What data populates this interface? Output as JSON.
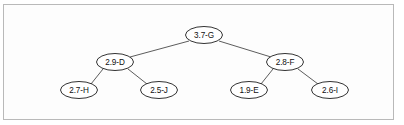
{
  "figure": {
    "kind": "binary-tree-diagram",
    "border_color": "#b9b9b9",
    "background_color": "#fdfdfd",
    "node_fill": "#ffffff",
    "node_stroke": "#1c1c1c",
    "edge_color": "#4a4a4a"
  },
  "tree": {
    "nodes": [
      {
        "id": "G",
        "label": "3.7-G",
        "cx": 204,
        "cy": 35,
        "rx": 18.5,
        "ry": 8.5
      },
      {
        "id": "D",
        "label": "2.9-D",
        "cx": 115,
        "cy": 62,
        "rx": 18.5,
        "ry": 8.5
      },
      {
        "id": "F",
        "label": "2.8-F",
        "cx": 285,
        "cy": 62,
        "rx": 18.5,
        "ry": 8.5
      },
      {
        "id": "H",
        "label": "2.7-H",
        "cx": 79,
        "cy": 90,
        "rx": 18.5,
        "ry": 8.5
      },
      {
        "id": "J",
        "label": "2.5-J",
        "cx": 159,
        "cy": 90,
        "rx": 18.5,
        "ry": 8.5
      },
      {
        "id": "E",
        "label": "1.9-E",
        "cx": 249,
        "cy": 90,
        "rx": 18.5,
        "ry": 8.5
      },
      {
        "id": "I",
        "label": "2.6-I",
        "cx": 330,
        "cy": 90,
        "rx": 18.5,
        "ry": 8.5
      }
    ],
    "edges": [
      {
        "id": "edge-G-D",
        "from": "G",
        "to": "D",
        "x1": 189,
        "y1": 41,
        "x2": 130,
        "y2": 57
      },
      {
        "id": "edge-G-F",
        "from": "G",
        "to": "F",
        "x1": 219,
        "y1": 41,
        "x2": 271,
        "y2": 57
      },
      {
        "id": "edge-D-H",
        "from": "D",
        "to": "H",
        "x1": 103,
        "y1": 69,
        "x2": 91,
        "y2": 84
      },
      {
        "id": "edge-D-J",
        "from": "D",
        "to": "J",
        "x1": 128,
        "y1": 69,
        "x2": 147,
        "y2": 84
      },
      {
        "id": "edge-F-E",
        "from": "F",
        "to": "E",
        "x1": 273,
        "y1": 69,
        "x2": 261,
        "y2": 84
      },
      {
        "id": "edge-F-I",
        "from": "F",
        "to": "I",
        "x1": 298,
        "y1": 69,
        "x2": 318,
        "y2": 84
      }
    ]
  }
}
